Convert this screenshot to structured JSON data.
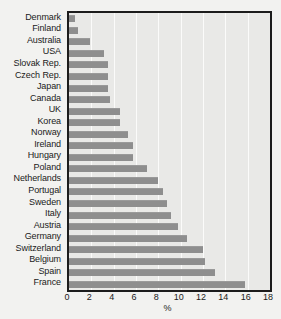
{
  "chart_data": {
    "type": "bar",
    "orientation": "horizontal",
    "title": "",
    "subtitle": "",
    "xlabel": "%",
    "ylabel": "",
    "xlim": [
      0,
      18
    ],
    "xticks": [
      0,
      2,
      4,
      6,
      8,
      10,
      12,
      14,
      16,
      18
    ],
    "grid": true,
    "legend": null,
    "categories": [
      "Denmark",
      "Finland",
      "Australia",
      "USA",
      "Slovak Rep.",
      "Czech Rep.",
      "Japan",
      "Canada",
      "UK",
      "Korea",
      "Norway",
      "Ireland",
      "Hungary",
      "Poland",
      "Netherlands",
      "Portugal",
      "Sweden",
      "Italy",
      "Austria",
      "Germany",
      "Switzerland",
      "Belgium",
      "Spain",
      "France"
    ],
    "values": [
      0.5,
      0.8,
      1.9,
      3.1,
      3.5,
      3.5,
      3.5,
      3.7,
      4.6,
      4.6,
      5.3,
      5.7,
      5.7,
      7.0,
      8.0,
      8.4,
      8.8,
      9.1,
      9.8,
      10.6,
      12.0,
      12.2,
      13.1,
      15.8
    ],
    "bar_color": "#8e8e8e",
    "plot_background": "#e9e9e7",
    "page_background": "#f2f2f0",
    "frame_color": "#1c1c1c",
    "gridline_color": "#fbfbfa"
  }
}
